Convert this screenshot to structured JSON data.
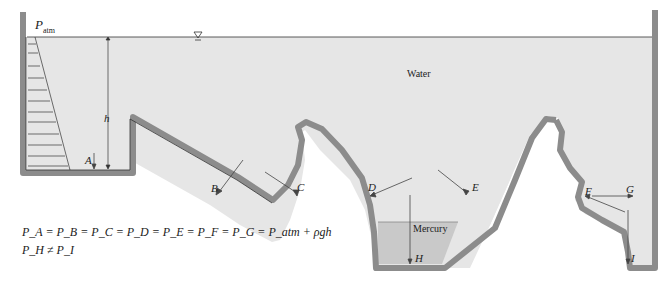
{
  "diagram": {
    "colors": {
      "water": "#e6e6e6",
      "mercury": "#c8c8c8",
      "wall": "#8c8c8c",
      "line": "#333333",
      "background": "#ffffff"
    },
    "labels": {
      "p_atm": "P",
      "p_atm_sub": "atm",
      "h": "h",
      "water": "Water",
      "mercury": "Mercury",
      "free_surface_symbol": "∇"
    },
    "points": [
      {
        "name": "A"
      },
      {
        "name": "B"
      },
      {
        "name": "C"
      },
      {
        "name": "D"
      },
      {
        "name": "E"
      },
      {
        "name": "F"
      },
      {
        "name": "G"
      },
      {
        "name": "H"
      },
      {
        "name": "I"
      }
    ],
    "equations": {
      "line1": "P_A = P_B = P_C = P_D = P_E = P_F = P_G = P_atm + ρgh",
      "line2": "P_H ≠ P_I"
    }
  }
}
